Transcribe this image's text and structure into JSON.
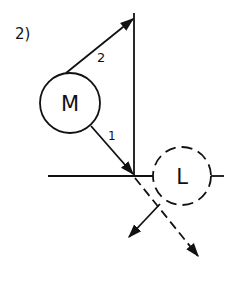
{
  "figure": {
    "label": "2)",
    "nodes": [
      {
        "id": "M",
        "label": "M",
        "style": "solid"
      },
      {
        "id": "L",
        "label": "L",
        "style": "dashed"
      }
    ],
    "edges": [
      {
        "id": "path-1",
        "label": "1",
        "from": "M",
        "to": "reflection-point",
        "style": "solid-arrow"
      },
      {
        "id": "path-2",
        "label": "2",
        "from": "M",
        "to": "mirror-top",
        "style": "solid-arrow"
      }
    ],
    "colors": {
      "ink": "#111111",
      "background": "#ffffff"
    }
  }
}
